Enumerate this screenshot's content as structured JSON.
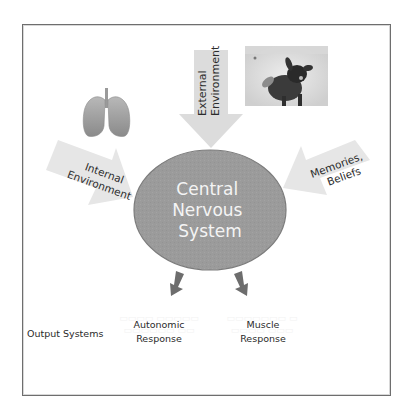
{
  "diagram": {
    "center": {
      "lines": [
        "Central",
        "Nervous",
        "System"
      ],
      "fill_color": "#9b9b9b",
      "stroke_color": "#7c7c7c",
      "text_color": "#f4f4f4"
    },
    "inputs": [
      {
        "id": "internal",
        "lines": [
          "Internal",
          "Environment"
        ],
        "icon": "lungs-icon",
        "arrow_color": "#e6e6e6"
      },
      {
        "id": "external",
        "lines": [
          "External",
          "Environment"
        ],
        "icon": "dog-photo",
        "arrow_color": "#dcdcdc"
      },
      {
        "id": "memories",
        "lines": [
          "Memories,",
          "Beliefs"
        ],
        "arrow_color": "#e6e6e6"
      }
    ],
    "outputs": {
      "heading": "Output Systems",
      "items": [
        {
          "id": "autonomic",
          "lines": [
            "Autonomic",
            "Response"
          ]
        },
        {
          "id": "muscle",
          "lines": [
            "Muscle",
            "Response"
          ]
        }
      ],
      "arrow_color": "#6d6d6d"
    },
    "colors": {
      "frame_border": "#6e6e6e",
      "background": "#ffffff"
    }
  }
}
